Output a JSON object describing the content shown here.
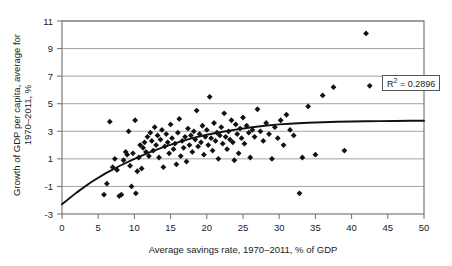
{
  "chart_data": {
    "type": "scatter",
    "title": "",
    "xlabel": "Average savings rate, 1970–2011, % of GDP",
    "ylabel": "Growth of GDP per capita, average for 1970–2011, %",
    "xlim": [
      0,
      50
    ],
    "ylim": [
      -3,
      11
    ],
    "xticks": [
      0,
      5,
      10,
      15,
      20,
      25,
      30,
      35,
      40,
      45,
      50
    ],
    "yticks": [
      -3,
      -1,
      1,
      3,
      5,
      7,
      9,
      11
    ],
    "grid": "horizontal",
    "legend": "none",
    "annotations": [
      {
        "name": "r2-label",
        "text": "R² = 0.2896",
        "x": 44.5,
        "y": 6.2
      }
    ],
    "series": [
      {
        "name": "countries",
        "type": "scatter",
        "marker": "diamond",
        "color": "#111111",
        "points": [
          [
            5.8,
            -1.6
          ],
          [
            6.2,
            -0.8
          ],
          [
            6.6,
            3.7
          ],
          [
            7.0,
            0.4
          ],
          [
            7.3,
            1.0
          ],
          [
            7.6,
            0.2
          ],
          [
            7.9,
            -1.7
          ],
          [
            8.2,
            -1.6
          ],
          [
            8.5,
            0.9
          ],
          [
            8.8,
            1.5
          ],
          [
            9.0,
            1.3
          ],
          [
            9.2,
            3.0
          ],
          [
            9.4,
            0.5
          ],
          [
            9.6,
            -1.0
          ],
          [
            9.8,
            1.4
          ],
          [
            10.1,
            3.8
          ],
          [
            10.2,
            -1.5
          ],
          [
            10.4,
            0.1
          ],
          [
            10.6,
            1.1
          ],
          [
            10.8,
            2.0
          ],
          [
            11.0,
            0.3
          ],
          [
            11.2,
            1.8
          ],
          [
            11.4,
            2.2
          ],
          [
            11.6,
            1.5
          ],
          [
            11.8,
            2.6
          ],
          [
            12.0,
            1.2
          ],
          [
            12.2,
            2.9
          ],
          [
            12.4,
            2.3
          ],
          [
            12.6,
            1.6
          ],
          [
            12.8,
            3.3
          ],
          [
            13.0,
            2.0
          ],
          [
            13.2,
            2.7
          ],
          [
            13.4,
            1.1
          ],
          [
            13.6,
            2.4
          ],
          [
            13.8,
            3.1
          ],
          [
            14.0,
            0.4
          ],
          [
            14.2,
            1.9
          ],
          [
            14.4,
            2.8
          ],
          [
            14.6,
            2.2
          ],
          [
            14.8,
            1.4
          ],
          [
            15.0,
            3.5
          ],
          [
            15.2,
            2.5
          ],
          [
            15.4,
            1.7
          ],
          [
            15.6,
            2.1
          ],
          [
            15.8,
            0.6
          ],
          [
            16.0,
            2.9
          ],
          [
            16.2,
            3.9
          ],
          [
            16.4,
            1.2
          ],
          [
            16.6,
            2.3
          ],
          [
            16.8,
            1.8
          ],
          [
            17.0,
            2.6
          ],
          [
            17.2,
            0.8
          ],
          [
            17.4,
            3.2
          ],
          [
            17.6,
            2.0
          ],
          [
            17.8,
            2.7
          ],
          [
            18.0,
            1.5
          ],
          [
            18.2,
            3.0
          ],
          [
            18.4,
            2.4
          ],
          [
            18.6,
            4.5
          ],
          [
            18.8,
            1.9
          ],
          [
            19.0,
            2.8
          ],
          [
            19.2,
            2.2
          ],
          [
            19.4,
            3.4
          ],
          [
            19.6,
            1.3
          ],
          [
            19.8,
            2.6
          ],
          [
            20.0,
            3.1
          ],
          [
            20.2,
            2.0
          ],
          [
            20.4,
            5.5
          ],
          [
            20.6,
            2.5
          ],
          [
            20.8,
            1.6
          ],
          [
            21.0,
            3.6
          ],
          [
            21.2,
            2.3
          ],
          [
            21.4,
            2.9
          ],
          [
            21.6,
            1.0
          ],
          [
            21.8,
            2.7
          ],
          [
            22.0,
            3.3
          ],
          [
            22.2,
            2.1
          ],
          [
            22.4,
            4.3
          ],
          [
            22.6,
            2.6
          ],
          [
            22.8,
            1.7
          ],
          [
            23.0,
            3.0
          ],
          [
            23.2,
            2.4
          ],
          [
            23.4,
            3.8
          ],
          [
            23.6,
            2.2
          ],
          [
            23.8,
            0.9
          ],
          [
            24.0,
            3.5
          ],
          [
            24.2,
            2.8
          ],
          [
            24.4,
            1.4
          ],
          [
            24.6,
            3.2
          ],
          [
            24.8,
            2.5
          ],
          [
            25.0,
            4.0
          ],
          [
            25.2,
            2.1
          ],
          [
            25.5,
            3.4
          ],
          [
            25.8,
            2.9
          ],
          [
            26.0,
            1.1
          ],
          [
            26.3,
            3.1
          ],
          [
            26.6,
            2.6
          ],
          [
            27.0,
            4.6
          ],
          [
            27.4,
            3.0
          ],
          [
            27.8,
            2.3
          ],
          [
            28.2,
            3.6
          ],
          [
            28.6,
            2.8
          ],
          [
            29.0,
            1.0
          ],
          [
            29.4,
            3.3
          ],
          [
            29.8,
            2.5
          ],
          [
            30.2,
            3.8
          ],
          [
            30.6,
            2.0
          ],
          [
            31.0,
            4.2
          ],
          [
            31.5,
            3.1
          ],
          [
            32.0,
            2.7
          ],
          [
            32.8,
            -1.5
          ],
          [
            33.2,
            1.1
          ],
          [
            34.0,
            4.8
          ],
          [
            35.0,
            1.3
          ],
          [
            36.0,
            5.6
          ],
          [
            37.5,
            6.2
          ],
          [
            39.0,
            1.6
          ],
          [
            42.0,
            10.1
          ],
          [
            42.5,
            6.3
          ]
        ]
      },
      {
        "name": "trendline",
        "type": "line",
        "color": "#111111",
        "description": "fitted logarithmic/quadratic trend curve",
        "points": [
          [
            0,
            -2.3
          ],
          [
            2,
            -1.45
          ],
          [
            4,
            -0.7
          ],
          [
            6,
            -0.05
          ],
          [
            8,
            0.5
          ],
          [
            10,
            1.0
          ],
          [
            12,
            1.45
          ],
          [
            14,
            1.85
          ],
          [
            16,
            2.2
          ],
          [
            18,
            2.5
          ],
          [
            20,
            2.75
          ],
          [
            22,
            2.95
          ],
          [
            24,
            3.12
          ],
          [
            26,
            3.27
          ],
          [
            28,
            3.4
          ],
          [
            30,
            3.5
          ],
          [
            32,
            3.57
          ],
          [
            34,
            3.62
          ],
          [
            36,
            3.66
          ],
          [
            38,
            3.69
          ],
          [
            40,
            3.71
          ],
          [
            42,
            3.73
          ],
          [
            44,
            3.74
          ],
          [
            46,
            3.75
          ],
          [
            48,
            3.76
          ],
          [
            50,
            3.76
          ]
        ]
      }
    ]
  },
  "axes": {
    "x_tick_labels": [
      "0",
      "5",
      "10",
      "15",
      "20",
      "25",
      "30",
      "35",
      "40",
      "45",
      "50"
    ],
    "y_tick_labels": [
      "-3",
      "-1",
      "1",
      "3",
      "5",
      "7",
      "9",
      "11"
    ],
    "x_axis_title": "Average savings rate, 1970–2011, % of GDP",
    "y_axis_title_line1": "Growth of GDP per capita, average for",
    "y_axis_title_line2": "1970–2011, %"
  },
  "annotation_box": {
    "prefix": "R",
    "superscript": "2",
    "suffix": " = 0.2896",
    "full_text": "R² = 0.2896"
  },
  "style": {
    "marker_color": "#111111",
    "trend_color": "#111111",
    "grid_color": "#9a9a9a",
    "axis_color": "#6e6e6e",
    "background": "#ffffff"
  }
}
